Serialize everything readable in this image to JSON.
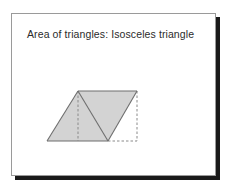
{
  "slide": {
    "title": "Area of triangles: Isosceles triangle",
    "background_color": "#ffffff",
    "border_color": "#9a9a9a",
    "shadow_color": "#1a1a1a",
    "title_color": "#2b2b2b"
  },
  "diagram": {
    "name": "isosceles-triangle-parallelogram-figure",
    "fill_color": "#d3d3d3",
    "stroke_color": "#6e6e6e",
    "dash_color": "#8a8a8a",
    "points": {
      "bottom_left": [
        5,
        57
      ],
      "apex": [
        36,
        7
      ],
      "top_right": [
        95,
        7
      ],
      "bottom_mid": [
        66,
        57
      ],
      "bottom_right": [
        95,
        57
      ],
      "foot_of_altitude": [
        36,
        57
      ]
    },
    "shapes": [
      {
        "id": "isosceles-triangle",
        "label": "Isosceles triangle",
        "polygon": "5,57 36,7 66,57",
        "filled": true
      },
      {
        "id": "rotated-copy-triangle",
        "label": "Rotated copy triangle",
        "polygon": "36,7 95,7 66,57",
        "filled": true
      }
    ],
    "solid_edges": [
      {
        "id": "left-edge",
        "from": [
          5,
          57
        ],
        "to": [
          36,
          7
        ]
      },
      {
        "id": "top-edge",
        "from": [
          36,
          7
        ],
        "to": [
          95,
          7
        ]
      },
      {
        "id": "right-slant-edge",
        "from": [
          95,
          7
        ],
        "to": [
          66,
          57
        ]
      },
      {
        "id": "bottom-edge",
        "from": [
          66,
          57
        ],
        "to": [
          5,
          57
        ]
      },
      {
        "id": "inner-diagonal",
        "from": [
          36,
          7
        ],
        "to": [
          66,
          57
        ]
      }
    ],
    "dashed_edges": [
      {
        "id": "altitude-line",
        "from": [
          36,
          7
        ],
        "to": [
          36,
          57
        ]
      },
      {
        "id": "extended-bottom-edge",
        "from": [
          66,
          57
        ],
        "to": [
          95,
          57
        ]
      },
      {
        "id": "right-vertical-edge",
        "from": [
          95,
          7
        ],
        "to": [
          95,
          57
        ]
      }
    ]
  }
}
